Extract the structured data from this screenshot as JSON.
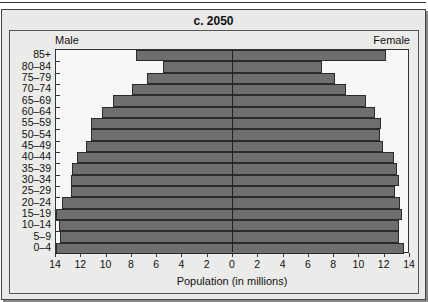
{
  "chart_data": {
    "type": "bar",
    "subtype": "population-pyramid",
    "title": "c. 2050",
    "xlabel": "Population (in millions)",
    "ylabel": "",
    "left_label": "Male",
    "right_label": "Female",
    "xlim": [
      -14,
      14
    ],
    "x_ticks": [
      14,
      12,
      10,
      8,
      6,
      4,
      2,
      0,
      2,
      4,
      6,
      8,
      10,
      12,
      14
    ],
    "categories": [
      "85+",
      "80–84",
      "75–79",
      "70–74",
      "65–69",
      "60–64",
      "55–59",
      "50–54",
      "45–49",
      "40–44",
      "35–39",
      "30–34",
      "25–29",
      "20–24",
      "15–19",
      "10–14",
      "5–9",
      "0–4"
    ],
    "series": [
      {
        "name": "Male",
        "color": "#6e6e6c",
        "values": [
          7.7,
          5.5,
          6.8,
          8.0,
          9.5,
          10.4,
          11.2,
          11.2,
          11.6,
          12.3,
          12.7,
          12.8,
          12.8,
          13.5,
          14.0,
          13.8,
          13.7,
          14.0
        ]
      },
      {
        "name": "Female",
        "color": "#6e6e6c",
        "values": [
          12.1,
          7.0,
          8.1,
          8.9,
          10.5,
          11.2,
          11.7,
          11.6,
          11.9,
          12.7,
          13.0,
          13.1,
          12.8,
          13.2,
          13.4,
          13.1,
          13.1,
          13.5
        ]
      }
    ],
    "grid": false,
    "legend": "none (side labels Male / Female above plot)"
  }
}
